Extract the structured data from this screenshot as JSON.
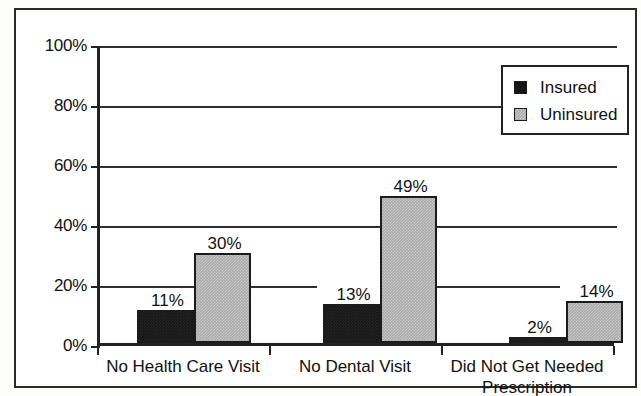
{
  "chart_data": {
    "type": "bar",
    "title": "",
    "subtitle": "",
    "xlabel": "",
    "ylabel": "",
    "ylim": [
      0,
      100
    ],
    "ytick_labels": [
      "100%",
      "80%",
      "60%",
      "40%",
      "20%",
      "0%"
    ],
    "ytick_values": [
      100,
      80,
      60,
      40,
      20,
      0
    ],
    "grid": "horizontal",
    "legend_position": "top-right",
    "value_labels_shown": true,
    "categories": [
      "No Health Care Visit",
      "No Dental Visit",
      "Did Not Get Needed Prescription"
    ],
    "category_label_lines": [
      [
        "No Health Care Visit"
      ],
      [
        "No Dental Visit"
      ],
      [
        "Did Not Get Needed",
        "Prescription"
      ]
    ],
    "series": [
      {
        "name": "Insured",
        "color": "#151515",
        "values": [
          11,
          13,
          2
        ],
        "value_labels": [
          "11%",
          "13%",
          "2%"
        ]
      },
      {
        "name": "Uninsured",
        "color": "#aaaaaa",
        "values": [
          30,
          49,
          14
        ],
        "value_labels": [
          "30%",
          "49%",
          "14%"
        ]
      }
    ]
  },
  "legend": {
    "items": [
      {
        "label": "Insured",
        "swatch": "insured"
      },
      {
        "label": "Uninsured",
        "swatch": "uninsured"
      }
    ]
  }
}
